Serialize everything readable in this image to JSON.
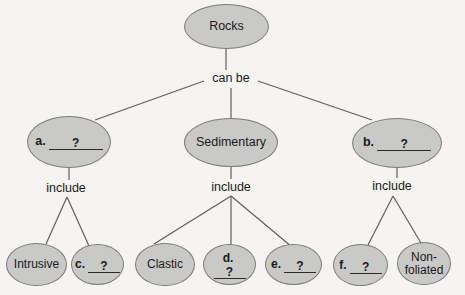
{
  "diagram": {
    "title_node": {
      "label": "Rocks"
    },
    "edge_labels": {
      "can_be": "can be",
      "include_left": "include",
      "include_middle": "include",
      "include_right": "include"
    },
    "level2": [
      {
        "prefix": "a.",
        "placeholder": "?"
      },
      {
        "label": "Sedimentary"
      },
      {
        "prefix": "b.",
        "placeholder": "?"
      }
    ],
    "level3": [
      {
        "label": "Intrusive"
      },
      {
        "prefix": "c.",
        "placeholder": "?"
      },
      {
        "label": "Clastic"
      },
      {
        "prefix": "d.",
        "placeholder": "?"
      },
      {
        "prefix": "e.",
        "placeholder": "?"
      },
      {
        "prefix": "f.",
        "placeholder": "?"
      },
      {
        "label": "Non-foliated"
      }
    ],
    "colors": {
      "oval_fill": "#c9c9c7",
      "oval_border": "#7b7b7b",
      "line": "#5f5f5f",
      "text": "#1a1a1a",
      "background": "#f5f4f1"
    }
  }
}
